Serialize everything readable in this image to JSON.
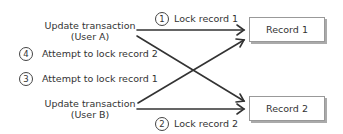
{
  "transactions": [
    {
      "line1": "Update transaction",
      "line2": "(User A)"
    },
    {
      "line1": "Update transaction",
      "line2": "(User B)"
    }
  ],
  "steps": [
    {
      "number": "1",
      "label": "Lock record 1"
    },
    {
      "number": "2",
      "label": "Lock record 2"
    },
    {
      "number": "3",
      "label": "Attempt to lock record 1"
    },
    {
      "number": "4",
      "label": "Attempt to lock record 2"
    }
  ],
  "records": [
    {
      "label": "Record 1"
    },
    {
      "label": "Record 2"
    }
  ],
  "colors": {
    "line": "#333333",
    "box_border": "#999999",
    "shadow": "#aaaaaa"
  }
}
